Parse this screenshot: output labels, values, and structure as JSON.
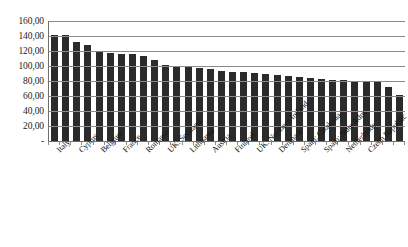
{
  "chart_data": {
    "type": "bar",
    "title": "",
    "subtitle": "",
    "xlabel": "",
    "ylabel": "",
    "ylim": [
      0,
      160
    ],
    "grid": true,
    "legend": null,
    "y_tick_labels": [
      "160,00",
      "140,00",
      "120,00",
      "100,00",
      "80,00",
      "60,00",
      "40,00",
      "20,00",
      "-"
    ],
    "y_ticks": [
      160,
      140,
      120,
      100,
      80,
      60,
      40,
      20,
      0
    ],
    "categories": [
      "Italy",
      "",
      "Cyprus",
      "",
      "Belgium",
      "",
      "France",
      "",
      "Romania",
      "",
      "UK: Scotland",
      "",
      "Lithuania",
      "",
      "Austria",
      "",
      "Finland",
      "",
      "UK: Northern Ireland",
      "",
      "Denmark",
      "",
      "Spain: Catalonia",
      "",
      "Spain: State Adm.",
      "",
      "Netherlands",
      "",
      "Czech Republic",
      "",
      "",
      ""
    ],
    "labeled_categories": [
      "Italy",
      "Cyprus",
      "Belgium",
      "France",
      "Romania",
      "UK: Scotland",
      "Lithuania",
      "Austria",
      "Finland",
      "UK: Northern Ireland",
      "Denmark",
      "Spain: Catalonia",
      "Spain: State Adm.",
      "Netherlands",
      "Czech Republic"
    ],
    "values": [
      142.0,
      141.5,
      132.0,
      128.5,
      119.0,
      117.5,
      116.5,
      115.5,
      113.0,
      108.0,
      101.5,
      99.0,
      99.0,
      97.5,
      95.5,
      93.5,
      92.0,
      91.5,
      90.5,
      89.5,
      88.5,
      87.0,
      85.5,
      84.0,
      83.0,
      82.0,
      81.5,
      80.5,
      79.5,
      78.5,
      72.0,
      62.0
    ],
    "bar_color": "#2b2b2b",
    "gridline_color": "#8a8a8a",
    "axis_color": "#6f6f6f",
    "background": "#ffffff"
  }
}
